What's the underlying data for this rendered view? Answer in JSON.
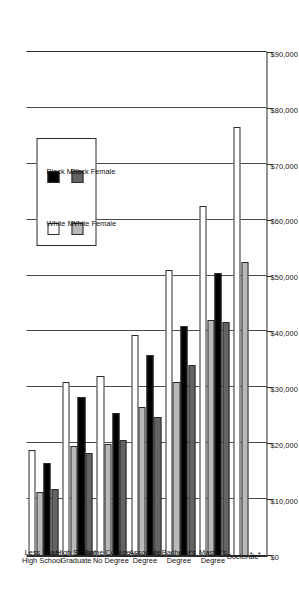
{
  "chart_data": {
    "type": "bar",
    "orientation": "horizontal",
    "title": "",
    "xlabel": "",
    "ylabel": "",
    "xlim": [
      0,
      90000
    ],
    "grid": true,
    "legend_position": "middle-left",
    "tick_labels": [
      "$90,000",
      "$80,000",
      "$70,000",
      "$60,000",
      "$50,000",
      "$40,000",
      "$30,000",
      "$20,000",
      "$10,000",
      "$0"
    ],
    "tick_values": [
      90000,
      80000,
      70000,
      60000,
      50000,
      40000,
      30000,
      20000,
      10000,
      0
    ],
    "categories": [
      "Less Than High School",
      "High School Graduate",
      "Some College—No Degree",
      "Associate Degree",
      "Bachelor's Degree",
      "Master's Degree",
      "Doctorate"
    ],
    "category_lines": [
      [
        "Less Than",
        "High School"
      ],
      [
        "High School",
        "Graduate"
      ],
      [
        "Some College—",
        "No Degree"
      ],
      [
        "Associate",
        "Degree"
      ],
      [
        "Bachelor's",
        "Degree"
      ],
      [
        "Master's",
        "Degree"
      ],
      [
        "Doctorate"
      ]
    ],
    "series": [
      {
        "name": "White Male",
        "key": "wm",
        "color": "#ffffff",
        "values": [
          18900,
          31100,
          32200,
          39600,
          51100,
          62600,
          76700
        ]
      },
      {
        "name": "White Female",
        "key": "wf",
        "color": "#b9b9b9",
        "values": [
          11500,
          19600,
          20000,
          26700,
          31100,
          42200,
          52600
        ]
      },
      {
        "name": "Black Male",
        "key": "bm",
        "color": "#000000",
        "values": [
          16700,
          28500,
          25600,
          35900,
          41100,
          50700,
          null
        ]
      },
      {
        "name": "Black Female",
        "key": "bf",
        "color": "#636363",
        "values": [
          11900,
          18500,
          20700,
          24800,
          34100,
          41900,
          null
        ]
      }
    ],
    "missing_marker": "*",
    "missing_note": "Black Male and Black Female values are not shown for Doctorate (marked with *)."
  },
  "legend": {
    "items": [
      {
        "label": "White Male",
        "key": "wm"
      },
      {
        "label": "White Female",
        "key": "wf"
      },
      {
        "label": "Black Male",
        "key": "bm"
      },
      {
        "label": "Black Female",
        "key": "bf"
      }
    ]
  }
}
